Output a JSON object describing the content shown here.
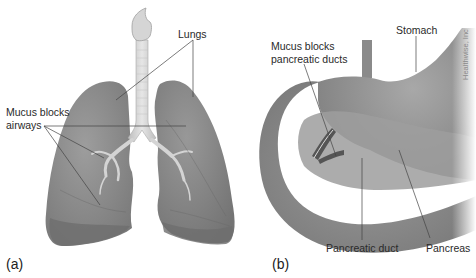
{
  "figure": {
    "panel_a": {
      "letter": "(a)",
      "labels": {
        "lungs": "Lungs",
        "mucus_airways_line1": "Mucus blocks",
        "mucus_airways_line2": "airways"
      }
    },
    "panel_b": {
      "letter": "(b)",
      "labels": {
        "stomach": "Stomach",
        "mucus_ducts_line1": "Mucus blocks",
        "mucus_ducts_line2": "pancreatic ducts",
        "pancreatic_duct": "Pancreatic duct",
        "pancreas": "Pancreas"
      }
    },
    "credit": "Healthwise, Inc",
    "colors": {
      "organ_gray": "#8f8f8f",
      "organ_dark": "#6f6f6f",
      "airway_light": "#d6d6d6",
      "leader_line": "#444444"
    }
  }
}
